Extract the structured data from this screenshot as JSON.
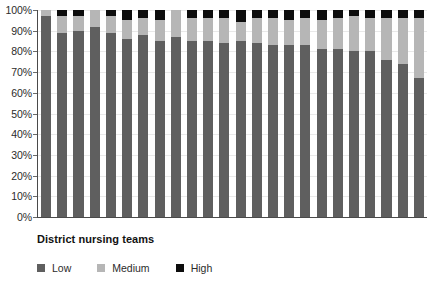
{
  "chart_data": {
    "type": "bar",
    "subtype": "stacked-percentage-column",
    "title": "",
    "caption": "District nursing teams",
    "xlabel": "District nursing teams",
    "ylabel": "",
    "ylim": [
      0,
      100
    ],
    "y_unit": "%",
    "grid": true,
    "legend_position": "bottom-left",
    "categories": [
      "Team 1",
      "Team 2",
      "Team 3",
      "Team 4",
      "Team 5",
      "Team 6",
      "Team 7",
      "Team 8",
      "Team 9",
      "Team 10",
      "Team 11",
      "Team 12",
      "Team 13",
      "Team 14",
      "Team 15",
      "Team 16",
      "Team 17",
      "Team 18",
      "Team 19",
      "Team 20",
      "Team 21",
      "Team 22",
      "Team 23",
      "Team 24"
    ],
    "y_ticks": [
      {
        "value": 100,
        "label": "100%"
      },
      {
        "value": 90,
        "label": "90%"
      },
      {
        "value": 80,
        "label": "80%"
      },
      {
        "value": 70,
        "label": "70%"
      },
      {
        "value": 60,
        "label": "60%"
      },
      {
        "value": 50,
        "label": "50%"
      },
      {
        "value": 40,
        "label": "40%"
      },
      {
        "value": 30,
        "label": "30%"
      },
      {
        "value": 20,
        "label": "20%"
      },
      {
        "value": 10,
        "label": "10%"
      },
      {
        "value": 0,
        "label": "0%"
      }
    ],
    "series": [
      {
        "name": "Low",
        "color": "#5f5f5f",
        "values": [
          97,
          89,
          90,
          92,
          89,
          86,
          88,
          85,
          87,
          85,
          85,
          84,
          85,
          84,
          83,
          83,
          83,
          81,
          81,
          80,
          80,
          76,
          74,
          67
        ]
      },
      {
        "name": "Medium",
        "color": "#b6b6b6",
        "values": [
          3,
          8,
          7,
          8,
          8,
          9,
          8,
          10,
          13,
          11,
          11,
          12,
          9,
          12,
          13,
          12,
          13,
          14,
          15,
          17,
          16,
          20,
          22,
          29
        ]
      },
      {
        "name": "High",
        "color": "#0d0d0d",
        "values": [
          0,
          3,
          3,
          0,
          3,
          5,
          4,
          5,
          0,
          4,
          4,
          4,
          6,
          4,
          4,
          5,
          4,
          5,
          4,
          3,
          4,
          4,
          4,
          4
        ]
      }
    ]
  },
  "legend": {
    "items": [
      {
        "label": "Low",
        "color": "#5f5f5f"
      },
      {
        "label": "Medium",
        "color": "#b6b6b6"
      },
      {
        "label": "High",
        "color": "#0d0d0d"
      }
    ]
  },
  "caption": {
    "text": "District nursing teams"
  }
}
